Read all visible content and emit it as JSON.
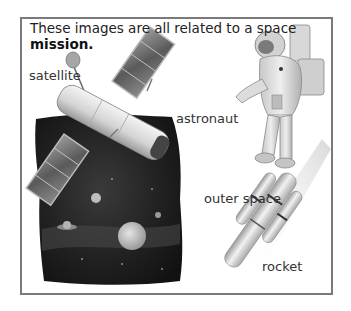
{
  "caption": {
    "text": "These images are all related to a space",
    "bold_word": "mission."
  },
  "labels": {
    "satellite": "satellite",
    "astronaut": "astronaut",
    "outer_space": "outer space",
    "rocket": "rocket"
  },
  "illustrations": [
    {
      "name": "satellite-illustration",
      "label": "satellite"
    },
    {
      "name": "astronaut-illustration",
      "label": "astronaut"
    },
    {
      "name": "outer-space-illustration",
      "label": "outer space"
    },
    {
      "name": "rocket-illustration",
      "label": "rocket"
    }
  ],
  "colors": {
    "frame_border": "#7a7a7a",
    "text": "#333333",
    "space_dark": "#1c1c1c"
  }
}
